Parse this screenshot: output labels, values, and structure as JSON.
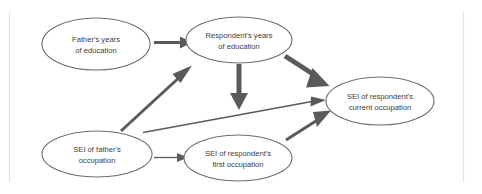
{
  "figure": {
    "kind": "path-diagram",
    "background_color": "#ffffff",
    "node_stroke_color": "#6e6e6e",
    "edge_color": "#5a5a5a",
    "text_color": "#3d3d3d",
    "rule_color": "#e2e2e2"
  },
  "nodes": [
    {
      "id": "father-education",
      "line1": "Father's years",
      "line2": "of education",
      "cx": 96,
      "cy": 44,
      "rx": 54,
      "ry": 26
    },
    {
      "id": "respondent-education",
      "line1": "Respondent's years",
      "line2": "of education",
      "cx": 239,
      "cy": 40,
      "rx": 53,
      "ry": 23
    },
    {
      "id": "respondent-current-occupation",
      "line1": "SEI of respondent's",
      "line2": "current occupation",
      "cx": 380,
      "cy": 101,
      "rx": 54,
      "ry": 24
    },
    {
      "id": "father-occupation",
      "line1": "SEI of father's",
      "line2": "occupation",
      "cx": 97,
      "cy": 154,
      "rx": 55,
      "ry": 23
    },
    {
      "id": "respondent-first-occupation",
      "line1": "SEI of respondent's",
      "line2": "first occupation",
      "cx": 238,
      "cy": 158,
      "rx": 54,
      "ry": 23
    }
  ],
  "edges": [
    {
      "id": "father-edu-to-resp-edu",
      "from": "father-education",
      "to": "respondent-education",
      "weight": "medium"
    },
    {
      "id": "resp-edu-to-current-occ",
      "from": "respondent-education",
      "to": "respondent-current-occupation",
      "weight": "thick"
    },
    {
      "id": "resp-edu-to-first-occ",
      "from": "respondent-education",
      "to": "respondent-first-occupation",
      "weight": "thick"
    },
    {
      "id": "father-occ-to-resp-edu",
      "from": "father-occupation",
      "to": "respondent-education",
      "weight": "medium"
    },
    {
      "id": "father-occ-to-first-occ",
      "from": "father-occupation",
      "to": "respondent-first-occupation",
      "weight": "thin"
    },
    {
      "id": "father-occ-to-current-occ",
      "from": "father-occupation",
      "to": "respondent-current-occupation",
      "weight": "thin"
    },
    {
      "id": "first-occ-to-current-occ",
      "from": "respondent-first-occupation",
      "to": "respondent-current-occupation",
      "weight": "medium"
    }
  ]
}
